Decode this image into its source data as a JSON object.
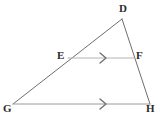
{
  "figure": {
    "type": "geometry-diagram",
    "shape": "triangle",
    "background_color": "#ffffff",
    "label_color": "#2b2b2b",
    "side_color": "#6e6e6e",
    "midsegment_color": "#b4b4b4",
    "base_color": "#9a9a9a",
    "tick_color": "#6e6e6e"
  },
  "points": {
    "D": {
      "label": "D",
      "x": 122,
      "y": 19,
      "label_x": 119,
      "label_y": 3
    },
    "E": {
      "label": "E",
      "x": 68,
      "y": 58,
      "label_x": 57,
      "label_y": 50
    },
    "F": {
      "label": "F",
      "x": 134,
      "y": 58,
      "label_x": 136,
      "label_y": 50
    },
    "G": {
      "label": "G",
      "x": 13,
      "y": 104,
      "label_x": 3,
      "label_y": 103
    },
    "H": {
      "label": "H",
      "x": 150,
      "y": 104,
      "label_x": 146,
      "label_y": 103
    }
  },
  "segments": [
    {
      "name": "DG",
      "from": "D",
      "to": "G",
      "color": "#6e6e6e",
      "width": 1
    },
    {
      "name": "DH",
      "from": "D",
      "to": "H",
      "color": "#6e6e6e",
      "width": 1
    },
    {
      "name": "GH",
      "from": "G",
      "to": "H",
      "color": "#9a9a9a",
      "width": 1
    },
    {
      "name": "EF",
      "from": "E",
      "to": "F",
      "color": "#b4b4b4",
      "width": 1
    }
  ],
  "parallel_marks": [
    {
      "name": "mark-on-EF",
      "on_segment": "EF",
      "glyph": "single-chevron-right",
      "x": 103,
      "y": 58
    },
    {
      "name": "mark-on-GH",
      "on_segment": "GH",
      "glyph": "single-chevron-right",
      "x": 103,
      "y": 104
    }
  ]
}
